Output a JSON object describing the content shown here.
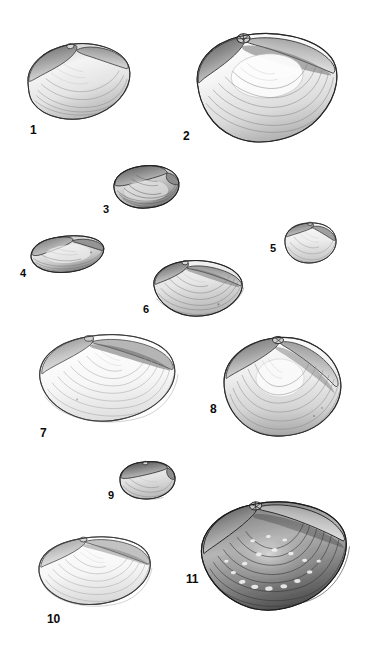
{
  "plate": {
    "title": "Bivalve shell specimen plate",
    "background_color": "#ffffff",
    "width": 382,
    "height": 656,
    "label_color": "#0a0a0a",
    "ink_color": "#3a3a3a",
    "shade_light": "#f2f2f2",
    "shade_mid": "#c9c9c9",
    "shade_dark": "#8a8a8a",
    "shade_deep": "#4a4a4a"
  },
  "figures": [
    {
      "id": "figure-1",
      "label": "1",
      "label_x": 30,
      "label_y": 124,
      "label_size": 12,
      "x": 22,
      "y": 38,
      "width": 112,
      "height": 85,
      "orientation": "exterior-left-valve",
      "form": "elongate-oval",
      "tilt": -6,
      "hinge": "top",
      "shading": "medium"
    },
    {
      "id": "figure-2",
      "label": "2",
      "label_x": 183,
      "label_y": 130,
      "label_size": 12,
      "x": 190,
      "y": 28,
      "width": 152,
      "height": 120,
      "orientation": "exterior-right-valve",
      "form": "broad-oval",
      "tilt": -4,
      "hinge": "top-left",
      "shading": "medium"
    },
    {
      "id": "figure-3",
      "label": "3",
      "label_x": 103,
      "label_y": 204,
      "label_size": 11,
      "x": 110,
      "y": 163,
      "width": 72,
      "height": 48,
      "orientation": "oblique-view",
      "form": "compact-rounded",
      "tilt": -3,
      "hinge": "top",
      "shading": "dark"
    },
    {
      "id": "figure-4",
      "label": "4",
      "label_x": 20,
      "label_y": 268,
      "label_size": 11,
      "x": 28,
      "y": 232,
      "width": 78,
      "height": 44,
      "orientation": "dorsal-view",
      "form": "elongate-low",
      "tilt": -4,
      "hinge": "top",
      "shading": "medium-dark"
    },
    {
      "id": "figure-5",
      "label": "5",
      "label_x": 270,
      "label_y": 243,
      "label_size": 11,
      "x": 281,
      "y": 219,
      "width": 58,
      "height": 48,
      "orientation": "exterior-valve",
      "form": "triangular-oval",
      "tilt": 0,
      "hinge": "top",
      "shading": "light"
    },
    {
      "id": "figure-6",
      "label": "6",
      "label_x": 143,
      "label_y": 304,
      "label_size": 11,
      "x": 150,
      "y": 258,
      "width": 96,
      "height": 62,
      "orientation": "exterior-left-valve",
      "form": "trigonal-oval",
      "tilt": -2,
      "hinge": "top",
      "shading": "medium"
    },
    {
      "id": "figure-7",
      "label": "7",
      "label_x": 40,
      "label_y": 427,
      "label_size": 12,
      "x": 34,
      "y": 328,
      "width": 146,
      "height": 98,
      "orientation": "exterior-right-valve",
      "form": "broad-oval",
      "tilt": -3,
      "hinge": "top",
      "shading": "light"
    },
    {
      "id": "figure-8",
      "label": "8",
      "label_x": 210,
      "label_y": 403,
      "label_size": 12,
      "x": 216,
      "y": 330,
      "width": 130,
      "height": 112,
      "orientation": "exterior-valve",
      "form": "rounded-triangular",
      "tilt": 0,
      "hinge": "top",
      "shading": "medium"
    },
    {
      "id": "figure-9",
      "label": "9",
      "label_x": 108,
      "label_y": 490,
      "label_size": 11,
      "x": 116,
      "y": 458,
      "width": 62,
      "height": 44,
      "orientation": "oblique-view",
      "form": "compact-rounded",
      "tilt": -2,
      "hinge": "top",
      "shading": "medium"
    },
    {
      "id": "figure-10",
      "label": "10",
      "label_x": 47,
      "label_y": 613,
      "label_size": 12,
      "x": 34,
      "y": 531,
      "width": 120,
      "height": 78,
      "orientation": "exterior-valve",
      "form": "broad-oval",
      "tilt": -3,
      "hinge": "top",
      "shading": "light"
    },
    {
      "id": "figure-11",
      "label": "11",
      "label_x": 186,
      "label_y": 573,
      "label_size": 12,
      "x": 196,
      "y": 495,
      "width": 156,
      "height": 120,
      "orientation": "exterior-valve",
      "form": "broad-oval",
      "tilt": -5,
      "hinge": "top-left",
      "shading": "very-dark"
    }
  ]
}
